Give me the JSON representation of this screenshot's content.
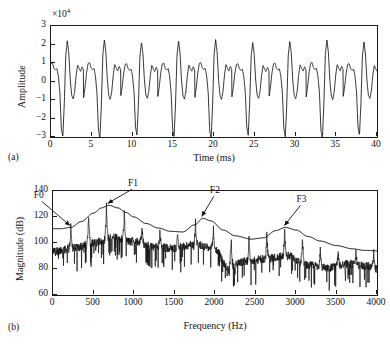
{
  "figure": {
    "panel_a_tag": "(a)",
    "panel_b_tag": "(b)"
  },
  "panel_a": {
    "xlabel": "Time (ms)",
    "ylabel": "Amplitude",
    "exponent_prefix": "×10",
    "exponent_power": "4",
    "xticks": [
      "0",
      "5",
      "10",
      "15",
      "20",
      "25",
      "30",
      "35",
      "40"
    ],
    "yticks": [
      "3",
      "2",
      "1",
      "0",
      "−1",
      "−2",
      "−3"
    ]
  },
  "panel_b": {
    "xlabel": "Frequency (Hz)",
    "ylabel": "Magnitude (dB)",
    "xticks": [
      "0",
      "500",
      "1000",
      "1500",
      "2000",
      "2500",
      "3000",
      "3500",
      "4000"
    ],
    "yticks": [
      "140",
      "120",
      "100",
      "80",
      "60"
    ],
    "annotations": [
      {
        "label": "F0",
        "freq": 220,
        "mag": 112
      },
      {
        "label": "F1",
        "freq": 690,
        "mag": 129
      },
      {
        "label": "F2",
        "freq": 1850,
        "mag": 119
      },
      {
        "label": "F3",
        "freq": 2870,
        "mag": 112
      }
    ]
  },
  "chart_data": [
    {
      "type": "line",
      "id": "waveform",
      "title": "",
      "xlabel": "Time (ms)",
      "ylabel": "Amplitude",
      "y_exponent": 4,
      "xlim": [
        0,
        40
      ],
      "ylim": [
        -3,
        3
      ],
      "grid": false,
      "legend": null,
      "description": "Periodic voiced-speech time waveform, fundamental period about 4.55 ms (F0 approx 220 Hz); each period shows a sharp negative glottal spike reaching -3e4, a tall positive peak near 2.2e4, and two to three smaller oscillations near +/-1e4.",
      "period_ms": 4.55,
      "pulse_count": 9,
      "peak_positive": 2.2,
      "peak_negative": -3.0,
      "series": [
        {
          "name": "amplitude",
          "units": "x10^4",
          "pulse_template_t": [
            0.0,
            0.18,
            0.36,
            0.55,
            0.73,
            0.91,
            1.09,
            1.27,
            1.45,
            1.64,
            1.82,
            2.0,
            2.18,
            2.36,
            2.55,
            2.73,
            2.91,
            3.09,
            3.27,
            3.45,
            3.64,
            3.82,
            4.0,
            4.18,
            4.36,
            4.55
          ],
          "pulse_template_y": [
            -0.85,
            -0.3,
            0.45,
            0.95,
            1.0,
            0.72,
            0.62,
            0.7,
            0.3,
            -0.6,
            -2.55,
            -3.0,
            -1.2,
            1.4,
            2.2,
            1.55,
            0.1,
            -0.75,
            -0.95,
            -0.55,
            0.35,
            0.9,
            0.7,
            0.55,
            0.8,
            0.6
          ]
        }
      ]
    },
    {
      "type": "line",
      "id": "spectrum",
      "title": "",
      "xlabel": "Frequency (Hz)",
      "ylabel": "Magnitude (dB)",
      "xlim": [
        0,
        4000
      ],
      "ylim": [
        60,
        140
      ],
      "grid": false,
      "legend": null,
      "description": "Magnitude spectrum of the voiced speech frame with harmonics spaced about 220 Hz, overlaid by a smooth LPC spectral envelope showing formants F1, F2 and F3. F0 marks the first harmonic.",
      "harmonic_spacing_hz": 220,
      "series": [
        {
          "name": "spectral envelope (LPC)",
          "x": [
            0,
            100,
            220,
            350,
            500,
            600,
            690,
            800,
            900,
            1000,
            1150,
            1300,
            1450,
            1600,
            1750,
            1850,
            1950,
            2100,
            2250,
            2450,
            2600,
            2750,
            2870,
            3000,
            3150,
            3300,
            3500,
            3700,
            3850,
            4000
          ],
          "y": [
            111,
            111,
            112,
            116.5,
            123,
            127,
            129,
            127,
            123.5,
            120,
            115,
            111.5,
            109,
            108.5,
            114,
            119,
            117,
            110,
            105.5,
            103,
            104,
            109.5,
            112,
            110,
            105,
            101.5,
            98,
            95.5,
            94.3,
            94
          ]
        },
        {
          "name": "harmonic peak magnitudes",
          "x": [
            220,
            450,
            690,
            920,
            1150,
            1380,
            1610,
            1840,
            2070,
            2300,
            2530,
            2760,
            2990,
            3230,
            3460,
            3700,
            3930
          ],
          "y": [
            112,
            122,
            129,
            122,
            111,
            108,
            108,
            119,
            107,
            104,
            104,
            110,
            110,
            95,
            91,
            94,
            94
          ]
        },
        {
          "name": "noise floor (approx)",
          "x": [
            0,
            250,
            500,
            750,
            1000,
            1250,
            1500,
            1750,
            2000,
            2150,
            2400,
            2650,
            2900,
            3150,
            3400,
            3650,
            3900,
            4000
          ],
          "y": [
            93,
            96,
            100,
            104,
            101,
            97,
            96,
            99,
            95,
            82,
            86,
            88,
            90,
            83,
            81,
            84,
            82,
            80
          ]
        }
      ]
    }
  ]
}
